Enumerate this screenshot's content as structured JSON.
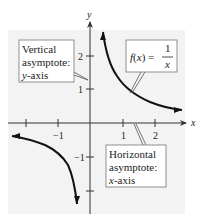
{
  "figure": {
    "type": "graph of rational function",
    "function_label": {
      "lhs": "f(x) = ",
      "numerator": "1",
      "denominator": "x"
    },
    "axes": {
      "x_label": "x",
      "y_label": "y"
    },
    "x_ticks": [
      {
        "value": -2,
        "label": ""
      },
      {
        "value": -1,
        "label": "−1"
      },
      {
        "value": 1,
        "label": "1"
      },
      {
        "value": 2,
        "label": "2"
      }
    ],
    "y_ticks": [
      {
        "value": 2,
        "label": "2"
      },
      {
        "value": 1,
        "label": "1"
      },
      {
        "value": -1,
        "label": "−1"
      },
      {
        "value": -2,
        "label": ""
      }
    ],
    "callouts": {
      "vertical": {
        "line1": "Vertical",
        "line2": "asymptote:",
        "line3_italic": "y",
        "line3_rest": "-axis"
      },
      "horizontal": {
        "line1": "Horizontal",
        "line2": "asymptote:",
        "line3_italic": "x",
        "line3_rest": "-axis"
      }
    },
    "colors": {
      "panel": "#f3f3f3",
      "curve": "#111111",
      "axis": "#333333",
      "box_border": "#777777"
    }
  }
}
